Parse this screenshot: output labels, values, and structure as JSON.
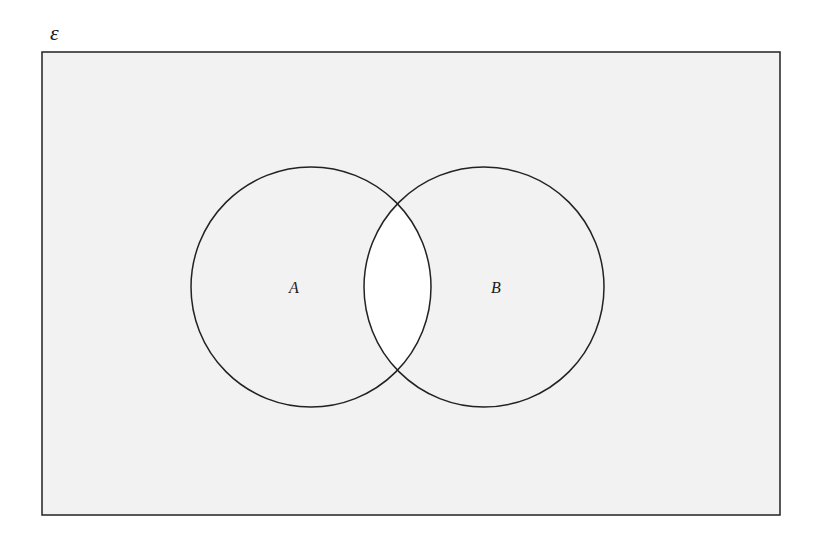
{
  "diagram": {
    "type": "venn",
    "universal_set_label": "ε",
    "sets": [
      {
        "label": "A",
        "cx": 311,
        "cy": 287,
        "r": 120
      },
      {
        "label": "B",
        "cx": 484,
        "cy": 287,
        "r": 120
      }
    ],
    "shaded_region": "(A ∩ B)'",
    "colors": {
      "shaded": "#f2f2f2",
      "unshaded": "#ffffff",
      "stroke": "#222222"
    }
  }
}
